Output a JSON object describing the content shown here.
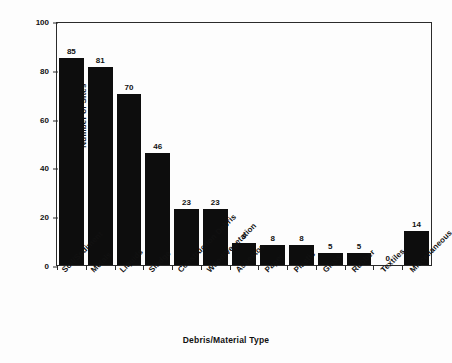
{
  "chart_data": {
    "type": "bar",
    "title": "",
    "xlabel": "Debris/Material Type",
    "ylabel": "Number of Sites",
    "ylim": [
      0,
      100
    ],
    "yticks": [
      0,
      20,
      40,
      60,
      80,
      100
    ],
    "ytick_labels": [
      "0",
      "20",
      "40",
      "60",
      "80",
      "100"
    ],
    "grid": false,
    "legend": "none",
    "categories": [
      "Soil/Sediment",
      "Metals",
      "Liquids",
      "Sludge",
      "Construction Debris",
      "Wood/Vegetation",
      "Asbestos",
      "Paper",
      "Plastic",
      "Glass",
      "Rubber",
      "Textiles",
      "Miscellaneous"
    ],
    "values": [
      85,
      81,
      70,
      46,
      23,
      23,
      9,
      8,
      8,
      5,
      5,
      0,
      14
    ],
    "value_labels": [
      "85",
      "81",
      "70",
      "46",
      "23",
      "23",
      "9",
      "8",
      "8",
      "5",
      "5",
      "0",
      "14"
    ],
    "bar_color": "#0d0d0d",
    "axis_color": "#2b2b2b",
    "background_color": "#fdfdfd"
  }
}
